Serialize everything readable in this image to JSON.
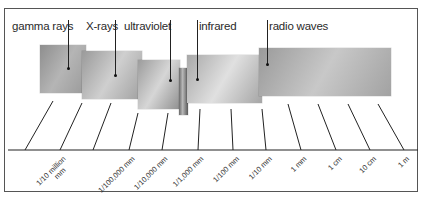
{
  "diagram": {
    "bands": [
      {
        "id": "gamma",
        "label": "gamma rays",
        "label_x": 12,
        "label_y": 20,
        "pointer_x": 68,
        "block": {
          "x": 40,
          "y": 45,
          "w": 46,
          "h": 48,
          "grad": [
            "#8e8e8e",
            "#b5b5b5",
            "#9a9a9a"
          ]
        },
        "dot_y": 68
      },
      {
        "id": "xrays",
        "label": "X-rays",
        "label_x": 86,
        "label_y": 20,
        "pointer_x": 115,
        "block": {
          "x": 82,
          "y": 51,
          "w": 60,
          "h": 48,
          "grad": [
            "#9a9a9a",
            "#cfcfcf",
            "#a0a0a0"
          ]
        },
        "dot_y": 75
      },
      {
        "id": "ultraviolet",
        "label": "ultraviolet",
        "label_x": 124,
        "label_y": 20,
        "pointer_x": 170,
        "block": {
          "x": 138,
          "y": 60,
          "w": 42,
          "h": 49,
          "grad": [
            "#9c9c9c",
            "#d6d6d6",
            "#8f8f8f"
          ]
        },
        "dot_y": 80
      },
      {
        "id": "visible",
        "label": "",
        "pointer_x": null,
        "block": {
          "x": 179,
          "y": 68,
          "w": 9,
          "h": 47,
          "grad": [
            "#6a6a6a",
            "#b8b8b8",
            "#5a5a5a"
          ]
        }
      },
      {
        "id": "infrared",
        "label": "infrared",
        "label_x": 199,
        "label_y": 20,
        "pointer_x": 197,
        "block": {
          "x": 187,
          "y": 55,
          "w": 75,
          "h": 48,
          "grad": [
            "#a8a8a8",
            "#e0e0e0",
            "#a5a5a5"
          ]
        },
        "dot_y": 79
      },
      {
        "id": "radio",
        "label": "radio waves",
        "label_x": 269,
        "label_y": 20,
        "pointer_x": 267,
        "block": {
          "x": 259,
          "y": 48,
          "w": 132,
          "h": 48,
          "grad": [
            "#9a9a9a",
            "#c8c8c8",
            "#a2a2a2"
          ]
        },
        "dot_y": 64
      }
    ],
    "axis": {
      "y": 150,
      "x1": 8,
      "x2": 418,
      "ticks": [
        {
          "top": [
            53,
            101
          ],
          "bottom": [
            25,
            150
          ]
        },
        {
          "top": [
            82,
            103
          ],
          "bottom": [
            60,
            150
          ]
        },
        {
          "top": [
            111,
            103
          ],
          "bottom": [
            93,
            150
          ]
        },
        {
          "top": [
            138,
            113
          ],
          "bottom": [
            129,
            150
          ]
        },
        {
          "top": [
            168,
            113
          ],
          "bottom": [
            162,
            150
          ]
        },
        {
          "top": [
            200,
            109
          ],
          "bottom": [
            198,
            150
          ]
        },
        {
          "top": [
            231,
            109
          ],
          "bottom": [
            233,
            150
          ]
        },
        {
          "top": [
            262,
            109
          ],
          "bottom": [
            266,
            150
          ]
        },
        {
          "top": [
            288,
            104
          ],
          "bottom": [
            301,
            150
          ]
        },
        {
          "top": [
            318,
            104
          ],
          "bottom": [
            336,
            150
          ]
        },
        {
          "top": [
            348,
            104
          ],
          "bottom": [
            370,
            150
          ]
        },
        {
          "top": [
            378,
            104
          ],
          "bottom": [
            404,
            150
          ]
        }
      ],
      "labels": [
        {
          "text": "1/10 million",
          "text2": "mm",
          "x": 62,
          "y": 155
        },
        {
          "text": "1/100,000 mm",
          "x": 131,
          "y": 155
        },
        {
          "text": "1/10,000 mm",
          "x": 164,
          "y": 155
        },
        {
          "text": "1/1,000 mm",
          "x": 200,
          "y": 155
        },
        {
          "text": "1/100 mm",
          "x": 235,
          "y": 155
        },
        {
          "text": "1/10 mm",
          "x": 268,
          "y": 155
        },
        {
          "text": "1 mm",
          "x": 303,
          "y": 155
        },
        {
          "text": "1 cm",
          "x": 338,
          "y": 155
        },
        {
          "text": "10 cm",
          "x": 372,
          "y": 155
        },
        {
          "text": "1 m",
          "x": 406,
          "y": 155
        }
      ]
    }
  }
}
